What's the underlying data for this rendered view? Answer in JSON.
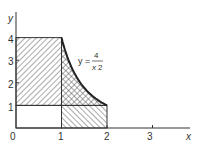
{
  "figure": {
    "x_axis_label": "x",
    "y_axis_label": "y",
    "origin_label": "0",
    "x_ticks": [
      "1",
      "2",
      "3"
    ],
    "y_ticks": [
      "1",
      "2",
      "3",
      "4"
    ],
    "curve_label": {
      "lhs": "y =",
      "numerator": "4",
      "denominator": "x",
      "exponent": "2"
    },
    "curve": {
      "expression": "y = 4/x^2",
      "x_from": 1,
      "x_to": 2
    },
    "regions": [
      {
        "name": "left-rectangle",
        "x": [
          0,
          1
        ],
        "y": [
          1,
          4
        ],
        "fill": "hatch-backslash"
      },
      {
        "name": "under-curve",
        "x": [
          1,
          2
        ],
        "y": [
          1,
          "4/x^2"
        ],
        "fill": "crosshatch"
      },
      {
        "name": "bottom-rectangle",
        "x": [
          1,
          2
        ],
        "y": [
          0,
          1
        ],
        "fill": "hatch-slash"
      },
      {
        "name": "unit-square",
        "x": [
          0,
          1
        ],
        "y": [
          0,
          1
        ],
        "fill": "none"
      }
    ],
    "axis_range": {
      "x": [
        0,
        3.2
      ],
      "y": [
        0,
        5
      ]
    },
    "colors": {
      "ink": "#333333",
      "hatch": "#555555",
      "background": "#ffffff"
    }
  }
}
